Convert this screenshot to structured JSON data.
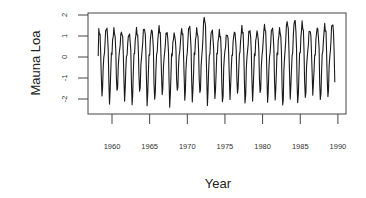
{
  "chart_data": {
    "type": "line",
    "title": "",
    "xlabel": "Year",
    "ylabel": "Mauna Loa",
    "xlim": [
      1956.8,
      1991.0
    ],
    "ylim": [
      -2.7,
      2.1
    ],
    "grid": false,
    "legend": null,
    "x_ticks": [
      1960,
      1965,
      1970,
      1975,
      1980,
      1985,
      1990
    ],
    "x_tick_labels": [
      "1960",
      "1965",
      "1970",
      "1975",
      "1980",
      "1985",
      "1990"
    ],
    "y_ticks": [
      -2,
      -1,
      0,
      1,
      2
    ],
    "y_tick_labels": [
      "-2",
      "-1",
      "0",
      "1",
      "2"
    ],
    "series": [
      {
        "name": "Mauna Loa",
        "color": "#1a1a1a",
        "start": 1958.2,
        "frequency": 12,
        "annual_peaks": [
          1.3,
          1.4,
          1.3,
          1.2,
          1.1,
          1.3,
          1.4,
          1.3,
          1.4,
          1.2,
          1.1,
          1.3,
          1.5,
          1.3,
          1.9,
          1.3,
          1.2,
          1.1,
          1.2,
          1.4,
          1.3,
          1.2,
          1.5,
          1.4,
          1.3,
          1.7,
          1.8,
          1.6,
          1.3,
          1.4,
          1.5,
          1.6
        ],
        "annual_troughs": [
          -1.8,
          -2.2,
          -1.7,
          -2.0,
          -2.3,
          -1.7,
          -2.2,
          -2.1,
          -1.8,
          -2.3,
          -1.7,
          -2.0,
          -2.1,
          -1.8,
          -2.2,
          -2.0,
          -2.2,
          -1.9,
          -1.8,
          -2.2,
          -2.0,
          -1.8,
          -2.1,
          -2.0,
          -2.4,
          -1.9,
          -2.2,
          -2.0,
          -1.7,
          -2.1,
          -1.9,
          -2.3
        ]
      }
    ]
  }
}
